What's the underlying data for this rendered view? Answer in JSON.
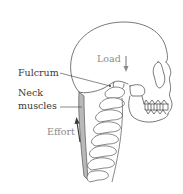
{
  "diagram": {
    "labels": {
      "load": "Load",
      "fulcrum": "Fulcrum",
      "neck_muscles_line1": "Neck",
      "neck_muscles_line2": "muscles",
      "effort": "Effort"
    },
    "arrows": {
      "load": {
        "direction": "down",
        "color": "#8a8a8a"
      },
      "effort": {
        "direction": "up",
        "color": "#3a3a3a"
      }
    },
    "colors": {
      "outline": "#555555",
      "muscle_fill": "#b9b9b9",
      "leader_line": "#3a3a3a",
      "background": "#ffffff"
    }
  }
}
